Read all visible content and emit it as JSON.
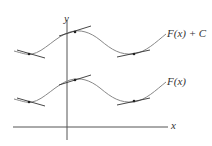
{
  "figure": {
    "axis_labels": {
      "x": "x",
      "y": "y"
    },
    "curves": [
      {
        "name": "upper",
        "label": "F(x) + C"
      },
      {
        "name": "lower",
        "label": "F(x)"
      }
    ]
  },
  "colors": {
    "curve": "#888888",
    "axis": "#555555",
    "tangent": "#333333",
    "point": "#222222"
  }
}
